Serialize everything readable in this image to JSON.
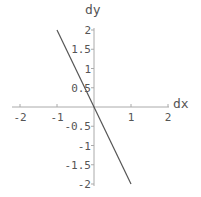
{
  "chart_data": {
    "type": "line",
    "title": "",
    "xlabel": "dx",
    "ylabel": "dy",
    "xlim": [
      -2,
      2
    ],
    "ylim": [
      -2,
      2
    ],
    "grid": false,
    "legend": null,
    "x_ticks": [
      -2,
      -1,
      1,
      2
    ],
    "x_tick_labels": [
      "-2",
      "-1",
      "1",
      "2"
    ],
    "y_ticks": [
      2,
      1.5,
      1,
      0.5,
      -0.5,
      -1,
      -1.5,
      -2
    ],
    "y_tick_labels": [
      "2",
      "1.5",
      "1",
      "0.5",
      "-0.5",
      "-1",
      "-1.5",
      "-2"
    ],
    "series": [
      {
        "name": "line",
        "x": [
          -1,
          1
        ],
        "y": [
          2,
          -2
        ],
        "equation": "dy = -2 dx",
        "color": "#555555"
      }
    ]
  },
  "colors": {
    "axis": "#aaaaaa",
    "line": "#555555",
    "text": "#555555"
  }
}
